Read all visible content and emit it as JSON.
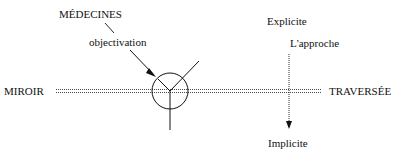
{
  "diagram": {
    "labels": {
      "left_axis": "MIROIR",
      "right_axis": "TRAVERSÉE",
      "top_axis": "Explicite",
      "bottom_axis": "Implicite",
      "approach": "L'approche",
      "medecines": "MÉDECINES",
      "objectivation": "objectivation"
    },
    "colors": {
      "ink": "#111111",
      "background": "#ffffff"
    }
  }
}
